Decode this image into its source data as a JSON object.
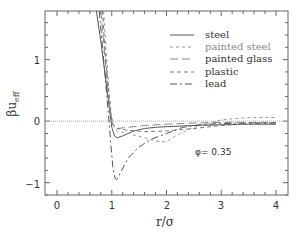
{
  "chart_data": {
    "type": "line",
    "title": "",
    "xlabel": "r/σ",
    "ylabel": "βu_eff",
    "xlim": [
      -0.22,
      4.22
    ],
    "ylim": [
      -1.2,
      1.79
    ],
    "xticks": [
      0,
      1,
      2,
      3,
      4
    ],
    "yticks": [
      -1,
      0,
      1
    ],
    "grid": false,
    "legend_position": "upper right",
    "reference_line": {
      "y": 0,
      "style": "dotted"
    },
    "annotation": "φ= 0.35",
    "series": [
      {
        "name": "steel",
        "style": "solid",
        "color": "#555555",
        "x": [
          0.72,
          0.8,
          0.88,
          0.95,
          1.0,
          1.05,
          1.1,
          1.2,
          1.4,
          1.6,
          1.8,
          2.0,
          2.5,
          3.0,
          3.5,
          4.0
        ],
        "y": [
          1.79,
          1.3,
          0.75,
          0.25,
          -0.1,
          -0.24,
          -0.27,
          -0.24,
          -0.16,
          -0.12,
          -0.1,
          -0.09,
          -0.07,
          -0.06,
          -0.05,
          -0.05
        ]
      },
      {
        "name": "painted steel",
        "style": "dotted",
        "color": "#999999",
        "x": [
          0.85,
          0.9,
          0.95,
          1.0,
          1.05,
          1.1,
          1.3,
          1.6,
          1.8,
          1.9,
          2.0,
          2.2,
          2.5,
          3.0,
          3.5,
          4.0
        ],
        "y": [
          1.79,
          1.1,
          0.5,
          0.05,
          -0.12,
          -0.16,
          -0.2,
          -0.27,
          -0.32,
          -0.34,
          -0.33,
          -0.22,
          -0.1,
          0.02,
          0.06,
          0.06
        ]
      },
      {
        "name": "painted glass",
        "style": "long-dash",
        "color": "#888888",
        "x": [
          0.8,
          0.86,
          0.92,
          0.97,
          1.0,
          1.05,
          1.1,
          1.3,
          1.6,
          2.0,
          2.5,
          3.0,
          3.5,
          4.0
        ],
        "y": [
          1.79,
          1.2,
          0.6,
          0.15,
          -0.02,
          -0.1,
          -0.12,
          -0.1,
          -0.07,
          -0.05,
          -0.03,
          -0.02,
          -0.02,
          -0.02
        ]
      },
      {
        "name": "plastic",
        "style": "short-dash",
        "color": "#777777",
        "x": [
          0.83,
          0.88,
          0.94,
          0.98,
          1.02,
          1.1,
          1.3,
          1.6,
          2.0,
          2.5,
          3.0,
          3.5,
          4.0
        ],
        "y": [
          1.79,
          1.1,
          0.5,
          0.12,
          -0.05,
          -0.12,
          -0.15,
          -0.17,
          -0.16,
          -0.12,
          -0.07,
          -0.04,
          -0.03
        ]
      },
      {
        "name": "lead",
        "style": "dash-dot",
        "color": "#555555",
        "x": [
          0.77,
          0.83,
          0.89,
          0.94,
          0.98,
          1.02,
          1.06,
          1.09,
          1.15,
          1.3,
          1.5,
          1.7,
          2.0,
          2.3,
          2.6,
          3.0,
          3.5,
          4.0
        ],
        "y": [
          1.79,
          1.2,
          0.6,
          0.1,
          -0.35,
          -0.75,
          -0.93,
          -0.95,
          -0.85,
          -0.6,
          -0.42,
          -0.3,
          -0.2,
          -0.1,
          -0.06,
          -0.04,
          -0.03,
          -0.03
        ]
      }
    ]
  },
  "legend": {
    "items": [
      {
        "label": "steel"
      },
      {
        "label": "painted steel"
      },
      {
        "label": "painted glass"
      },
      {
        "label": "plastic"
      },
      {
        "label": "lead"
      }
    ]
  },
  "axes": {
    "xlabel": "r/σ",
    "ylabel_main": "βu",
    "ylabel_sub": "eff",
    "x_tick_labels": [
      "0",
      "1",
      "2",
      "3",
      "4"
    ],
    "y_tick_labels": [
      "1",
      "0",
      "−1"
    ]
  },
  "annotation": {
    "text": "φ=  0.35"
  }
}
